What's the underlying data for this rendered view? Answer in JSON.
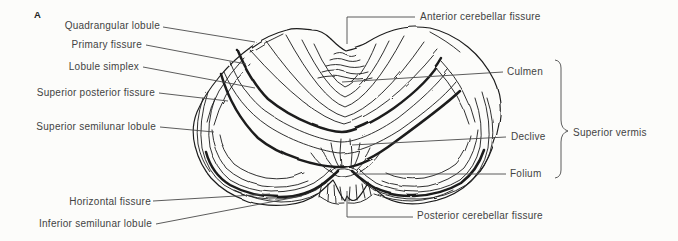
{
  "figure": {
    "panel_label": "A"
  },
  "labels": {
    "quadrangular_lobule": "Quadrangular lobule",
    "primary_fissure": "Primary fissure",
    "lobule_simplex": "Lobule simplex",
    "superior_posterior_fissure": "Superior posterior fissure",
    "superior_semilunar_lobule": "Superior semilunar lobule",
    "horizontal_fissure": "Horizontal fissure",
    "inferior_semilunar_lobule": "Inferior semilunar lobule",
    "anterior_cerebellar_fissure": "Anterior cerebellar fissure",
    "culmen": "Culmen",
    "declive": "Declive",
    "folium": "Folium",
    "superior_vermis": "Superior vermis",
    "posterior_cerebellar_fissure": "Posterior cerebellar fissure"
  },
  "colors": {
    "ink": "#1b1b1b",
    "leader_line": "#4a4a4a",
    "text": "#434343",
    "background": "#fcfcfa"
  }
}
